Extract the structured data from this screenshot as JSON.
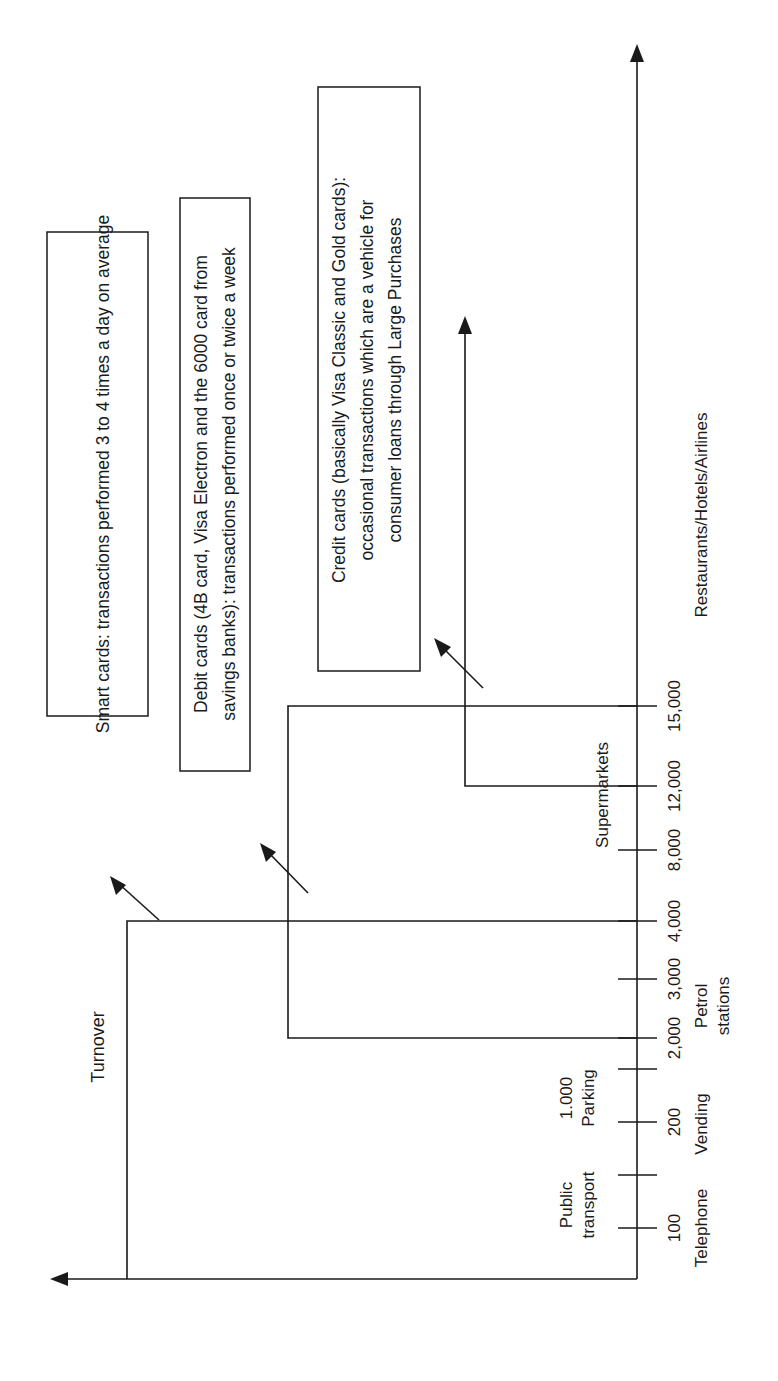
{
  "diagram": {
    "orientation": "rotated-90-ccw",
    "line_color": "#1a1a1a",
    "background": "#ffffff",
    "y_axis_label": "Turnover",
    "ticks": [
      {
        "value": "100",
        "category": [
          "Telephone"
        ],
        "y": 1228
      },
      {
        "value": "",
        "category": [
          "Public",
          "transport"
        ],
        "y": 1175
      },
      {
        "value": "200",
        "category": [
          "Vending"
        ],
        "y": 1122
      },
      {
        "value": "1.000",
        "category": [
          "Parking"
        ],
        "y": 1069
      },
      {
        "value": "2,000",
        "category": [
          "Petrol",
          "stations"
        ],
        "y": 1038
      },
      {
        "value": "3,000",
        "category": [],
        "y": 979
      },
      {
        "value": "4,000",
        "category": [],
        "y": 921
      },
      {
        "value": "8,000",
        "category": [
          "Supermarkets"
        ],
        "y": 850
      },
      {
        "value": "12,000",
        "category": [],
        "y": 786
      },
      {
        "value": "15,000",
        "category": [
          "Restaurants/Hotels/Airlines"
        ],
        "y": 706
      }
    ],
    "boxes": [
      {
        "id": "smart-cards",
        "lines": [
          "Smart cards: transactions performed 3 to 4 times a day on average"
        ]
      },
      {
        "id": "debit-cards",
        "lines": [
          "Debit cards (4B card, Visa Electron and the 6000 card from",
          "savings banks): transactions performed once or twice a week"
        ]
      },
      {
        "id": "credit-cards",
        "lines": [
          "Credit cards (basically Visa Classic and Gold cards):",
          "occasional transactions which are a vehicle for",
          "consumer loans through Large Purchases"
        ]
      }
    ],
    "tick_labels": {
      "t100": "100",
      "t200": "200",
      "t1000": "1.000",
      "t2000": "2,000",
      "t3000": "3,000",
      "t4000": "4,000",
      "t8000": "8,000",
      "t12000": "12,000",
      "t15000": "15,000"
    },
    "category_labels": {
      "telephone": "Telephone",
      "public": "Public",
      "transport": "transport",
      "vending": "Vending",
      "parking": "Parking",
      "petrol": "Petrol",
      "stations": "stations",
      "supermarkets": "Supermarkets",
      "restaurants": "Restaurants/Hotels/Airlines"
    }
  }
}
